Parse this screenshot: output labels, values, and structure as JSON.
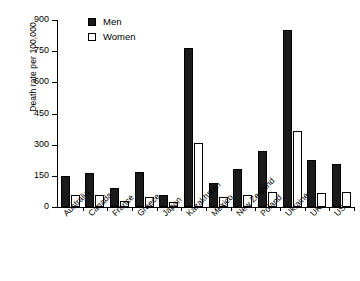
{
  "chart_data": {
    "type": "bar",
    "title": "",
    "xlabel": "",
    "ylabel": "Death rate per 100,000",
    "ylim": [
      0,
      900
    ],
    "yticks": [
      0,
      150,
      300,
      450,
      600,
      750,
      900
    ],
    "grid": false,
    "legend_position": "top-left-inside",
    "categories": [
      "Australia",
      "Canada",
      "France",
      "Greece",
      "Japan",
      "Kazakhstan",
      "Mexico",
      "New Zealand",
      "Poland",
      "Ukraine",
      "UK",
      "US"
    ],
    "series": [
      {
        "name": "Men",
        "color": "#1a1a1a",
        "values": [
          149,
          165,
          93,
          170,
          60,
          765,
          115,
          185,
          272,
          852,
          225,
          207
        ]
      },
      {
        "name": "Women",
        "color": "#ffffff",
        "values": [
          57,
          60,
          28,
          50,
          22,
          308,
          50,
          60,
          72,
          366,
          68,
          72
        ]
      }
    ]
  },
  "legend": {
    "items": [
      {
        "label": "Men",
        "swatch": "filled-black-square"
      },
      {
        "label": "Women",
        "swatch": "open-white-square"
      }
    ]
  }
}
